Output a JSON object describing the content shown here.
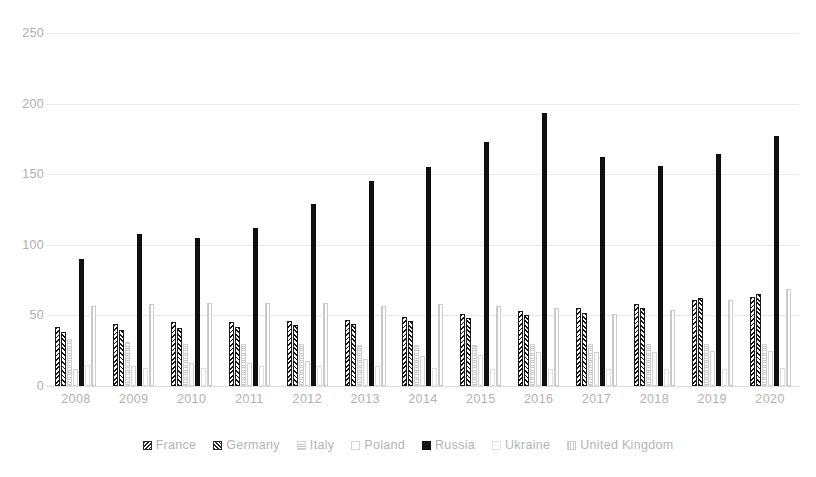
{
  "chart_data": {
    "type": "bar",
    "title": "",
    "subtitle": "",
    "xlabel": "",
    "ylabel": "",
    "ylim": [
      0,
      250
    ],
    "yticks": [
      0,
      50,
      100,
      150,
      200,
      250
    ],
    "ytick_labels": [
      "0",
      "50",
      "100",
      "150",
      "200",
      "250"
    ],
    "grid": true,
    "legend_position": "bottom",
    "categories": [
      "2008",
      "2009",
      "2010",
      "2011",
      "2012",
      "2013",
      "2014",
      "2015",
      "2016",
      "2017",
      "2018",
      "2019",
      "2020"
    ],
    "series": [
      {
        "name": "France",
        "pattern": "diagonal-hatch-dark",
        "values": [
          42,
          44,
          45,
          45,
          46,
          47,
          49,
          51,
          53,
          55,
          58,
          61,
          63
        ]
      },
      {
        "name": "Germany",
        "pattern": "diagonal-hatch-dark-reverse",
        "values": [
          38,
          40,
          41,
          42,
          43,
          44,
          46,
          48,
          50,
          52,
          55,
          62,
          65
        ]
      },
      {
        "name": "Italy",
        "pattern": "horizontal-line-light",
        "values": [
          33,
          31,
          30,
          30,
          30,
          29,
          29,
          29,
          30,
          30,
          30,
          30,
          30
        ]
      },
      {
        "name": "Poland",
        "pattern": "solid-outline-light",
        "values": [
          12,
          14,
          16,
          16,
          18,
          19,
          21,
          22,
          24,
          24,
          24,
          25,
          25
        ]
      },
      {
        "name": "Russia",
        "pattern": "solid-black",
        "values": [
          90,
          108,
          105,
          112,
          129,
          145,
          155,
          173,
          193,
          162,
          156,
          164,
          177
        ]
      },
      {
        "name": "Ukraine",
        "pattern": "blank-outline-light",
        "values": [
          15,
          13,
          13,
          14,
          14,
          14,
          13,
          12,
          12,
          12,
          12,
          12,
          13
        ]
      },
      {
        "name": "United Kingdom",
        "pattern": "vertical-line-light",
        "values": [
          57,
          58,
          59,
          59,
          59,
          57,
          58,
          57,
          55,
          51,
          54,
          61,
          69
        ]
      }
    ]
  },
  "axis": {
    "y_ticks": [
      "250",
      "200",
      "150",
      "100",
      "50",
      "0"
    ]
  },
  "legend": {
    "items": [
      {
        "label": "France",
        "marker": "swatch-hatch-icon"
      },
      {
        "label": "Germany",
        "marker": "swatch-hatch-icon"
      },
      {
        "label": "Italy",
        "marker": "swatch-lines-icon"
      },
      {
        "label": "Poland",
        "marker": "swatch-outline-icon"
      },
      {
        "label": "Russia",
        "marker": "swatch-solid-icon"
      },
      {
        "label": "Ukraine",
        "marker": "swatch-blank-icon"
      },
      {
        "label": "United Kingdom",
        "marker": "swatch-grid-icon"
      }
    ]
  },
  "colors": {
    "dark": "#141414",
    "light_gray": "#c8c8c8",
    "gridline": "#e9e9e9",
    "text": "#b0b0b0",
    "background": "#ffffff"
  }
}
